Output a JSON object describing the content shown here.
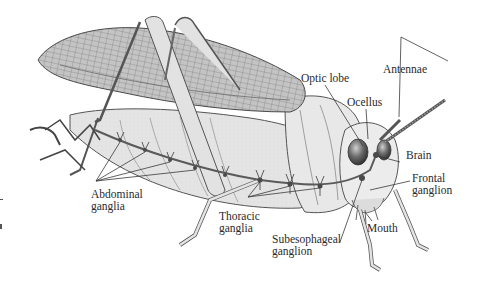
{
  "diagram": {
    "labels": {
      "antennae": "Antennae",
      "optic_lobe": "Optic lobe",
      "ocellus": "Ocellus",
      "brain": "Brain",
      "frontal_ganglion": [
        "Frontal",
        "ganglion"
      ],
      "mouth": "Mouth",
      "subesophageal_ganglion": [
        "Subesophageal",
        "ganglion"
      ],
      "thoracic_ganglia": [
        "Thoracic",
        "ganglia"
      ],
      "abdominal_ganglia": [
        "Abdominal",
        "ganglia"
      ]
    },
    "colors": {
      "background": "#ffffff",
      "ink": "#2a2a2a",
      "body_fill": "#e6e6e6",
      "wing_fill": "#bdbdbd",
      "nerve_cord": "#5a5a5a"
    }
  }
}
